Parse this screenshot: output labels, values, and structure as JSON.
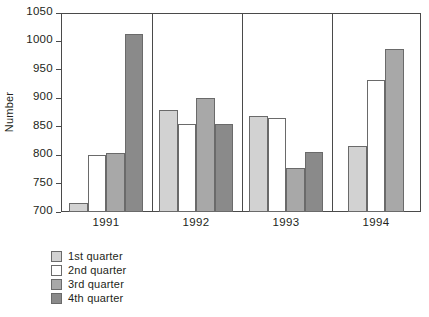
{
  "chart_data": {
    "type": "bar",
    "title": "",
    "subtitle": "",
    "xlabel": "",
    "ylabel": "Number",
    "categories": [
      "1991",
      "1992",
      "1993",
      "1994"
    ],
    "ylim": [
      700,
      1050
    ],
    "yticks": [
      700,
      750,
      800,
      850,
      900,
      950,
      1000,
      1050
    ],
    "ytick_labels": [
      "700",
      "750",
      "800",
      "850",
      "900",
      "950",
      "1000",
      "1050"
    ],
    "grid": false,
    "legend_position": "below-left",
    "group_dividers": true,
    "series": [
      {
        "name": "1st quarter",
        "color": "#d2d2d2",
        "values": [
          715,
          880,
          868,
          816
        ]
      },
      {
        "name": "2nd quarter",
        "color": "#ffffff",
        "values": [
          800,
          854,
          866,
          933
        ]
      },
      {
        "name": "3rd quarter",
        "color": "#a8a8a8",
        "values": [
          804,
          900,
          777,
          987
        ]
      },
      {
        "name": "4th quarter",
        "color": "#8a8a8a",
        "values": [
          1013,
          855,
          805,
          null
        ]
      }
    ]
  },
  "legend": {
    "items": [
      {
        "label": "1st quarter",
        "color": "#d2d2d2"
      },
      {
        "label": "2nd quarter",
        "color": "#ffffff"
      },
      {
        "label": "3rd quarter",
        "color": "#a8a8a8"
      },
      {
        "label": "4th quarter",
        "color": "#8a8a8a"
      }
    ]
  },
  "axis": {
    "y_title": "Number",
    "outline_color": "#4a4a4a",
    "bar_outline_color": "#6a6a6a"
  }
}
